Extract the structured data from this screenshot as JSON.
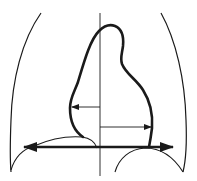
{
  "diagram": {
    "title": "",
    "type": "cardiothoracic-ratio-schematic",
    "colors": {
      "stroke": "#1a1a1a",
      "background": "#ffffff"
    },
    "elements": {
      "thoracic_outline": [
        "left-chest-wall",
        "right-chest-wall"
      ],
      "heart_outline": "heart-silhouette",
      "midline": "vertical-midline",
      "measurements": [
        {
          "name": "left-heart-width-arrow",
          "direction": "left"
        },
        {
          "name": "right-heart-width-arrow",
          "direction": "right"
        },
        {
          "name": "thoracic-width-arrow",
          "direction": "both"
        }
      ],
      "diaphragm": [
        "left-hemidiaphragm",
        "right-hemidiaphragm"
      ]
    },
    "labels": []
  }
}
